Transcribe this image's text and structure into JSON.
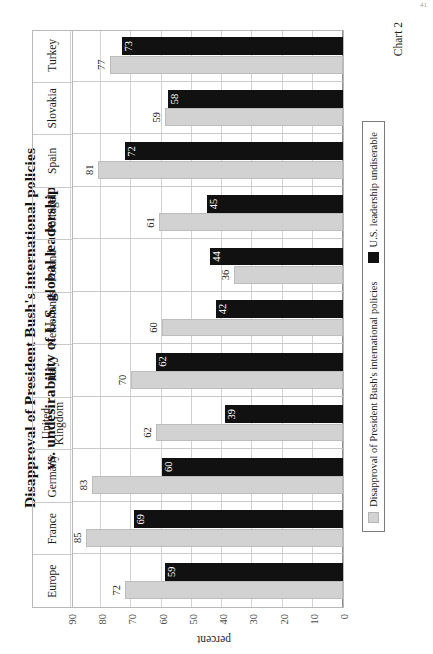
{
  "page": {
    "number": "41"
  },
  "caption": "Chart 2",
  "chart_data": {
    "type": "bar",
    "title": "Disapproval of President Bush's international policies vs. undesirability of U.S. global leadership",
    "title_line1": "Disapproval of President Bush's international policies",
    "title_line2": "vs. undesirability of U.S. global leadership",
    "orientation": "vertical-rotated-90ccw",
    "xlabel": "",
    "ylabel": "percent",
    "ylim": [
      0,
      90
    ],
    "yticks": [
      0,
      10,
      20,
      30,
      40,
      50,
      60,
      70,
      80,
      90
    ],
    "ytick_labels": [
      "0",
      "10",
      "20",
      "30",
      "40",
      "50",
      "60",
      "70",
      "80",
      "90"
    ],
    "grid": true,
    "legend_position": "bottom",
    "categories": [
      "Europe",
      "France",
      "Germany",
      "United Kingdom",
      "Italy",
      "Netherlands",
      "Poland",
      "Portugal",
      "Spain",
      "Slovakia",
      "Turkey"
    ],
    "series": [
      {
        "name": "Disapproval of President Bush's international policies",
        "color": "#d2d2d2",
        "values": [
          72,
          85,
          83,
          62,
          70,
          60,
          36,
          61,
          81,
          59,
          77
        ]
      },
      {
        "name": "U.S. leadership undiserable",
        "color": "#111111",
        "values": [
          59,
          69,
          60,
          39,
          62,
          42,
          44,
          45,
          72,
          58,
          73
        ]
      }
    ]
  }
}
